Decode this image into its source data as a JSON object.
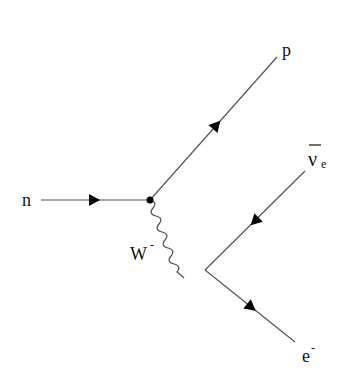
{
  "diagram": {
    "type": "feynman",
    "process": "beta decay",
    "colors": {
      "line": "#555555",
      "arrow": "#000000",
      "text": "#111111",
      "background": "#ffffff"
    },
    "vertices": [
      {
        "id": "v1",
        "x": 150,
        "y": 200,
        "dot": true
      },
      {
        "id": "v2",
        "x": 205,
        "y": 270,
        "dot": false
      }
    ],
    "particles": [
      {
        "id": "neutron",
        "label": "n",
        "kind": "fermion",
        "from": [
          41,
          200
        ],
        "to": [
          150,
          200
        ],
        "arrow_dir": "right"
      },
      {
        "id": "proton",
        "label": "p",
        "kind": "fermion",
        "from": [
          150,
          200
        ],
        "to": [
          277,
          57
        ],
        "arrow_dir": "up-right"
      },
      {
        "id": "w-boson",
        "label": "W",
        "charge": "-",
        "kind": "boson",
        "from": [
          150,
          200
        ],
        "to": [
          205,
          270
        ]
      },
      {
        "id": "antineutrino",
        "label": "ν",
        "subscript": "e",
        "bar": true,
        "kind": "fermion",
        "from": [
          305,
          171
        ],
        "to": [
          205,
          270
        ],
        "arrow_dir": "down-left"
      },
      {
        "id": "electron",
        "label": "e",
        "charge": "-",
        "kind": "fermion",
        "from": [
          205,
          270
        ],
        "to": [
          295,
          342
        ],
        "arrow_dir": "down-right"
      }
    ],
    "labels": {
      "n": "n",
      "p": "p",
      "w": "W",
      "w_sup": "-",
      "nu": "ν",
      "nu_sub": "e",
      "e": "e",
      "e_sup": "-"
    }
  }
}
